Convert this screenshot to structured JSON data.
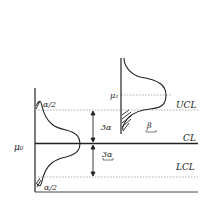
{
  "diagram": {
    "type": "control-chart-illustration",
    "labels": {
      "mu0": "μ₀",
      "mu1": "μ₁",
      "ucl": "UCL",
      "cl": "CL",
      "lcl": "LCL",
      "alpha_half_top": "α/2",
      "alpha_half_bottom": "α/2",
      "three_sigma_upper": "3α",
      "three_sigma_lower": "3α",
      "beta": "β"
    },
    "colors": {
      "line": "#222222",
      "dotted": "#9a9a9a"
    }
  }
}
